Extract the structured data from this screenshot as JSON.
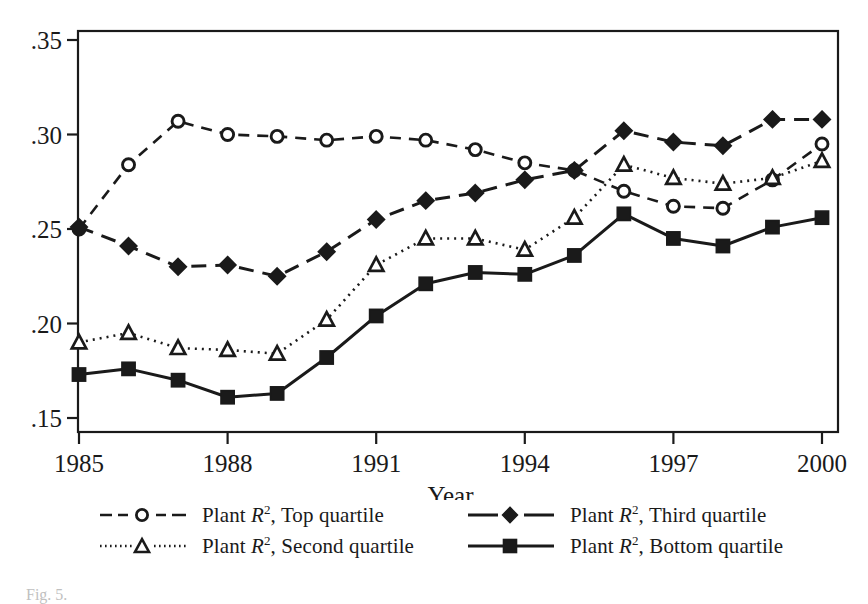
{
  "figure": {
    "caption_fragment": "Fig. 5.",
    "background": "#ffffff",
    "ink": "#1a1a1a"
  },
  "axes": {
    "y_tick_labels": [
      ".35",
      ".30",
      ".25",
      ".20",
      ".15"
    ],
    "x_tick_labels": [
      "1985",
      "1988",
      "1991",
      "1994",
      "1997",
      "2000"
    ],
    "x_title": "Year",
    "y_title": ""
  },
  "legend": {
    "position": "below-plot",
    "entries": [
      {
        "name": "legend-top-quartile",
        "prefix": "Plant ",
        "symbol_text": "R",
        "sup": "2",
        "suffix": ", Top quartile",
        "full_label": "Plant R2, Top quartile",
        "marker": "open-circle",
        "line": "dashed",
        "color": "#1a1a1a"
      },
      {
        "name": "legend-third-quartile",
        "prefix": "Plant ",
        "symbol_text": "R",
        "sup": "2",
        "suffix": ", Third quartile",
        "full_label": "Plant R2, Third quartile",
        "marker": "filled-diamond",
        "line": "long-dash",
        "color": "#1a1a1a"
      },
      {
        "name": "legend-second-quartile",
        "prefix": "Plant ",
        "symbol_text": "R",
        "sup": "2",
        "suffix": ", Second quartile",
        "full_label": "Plant R2, Second quartile",
        "marker": "open-triangle",
        "line": "dotted",
        "color": "#1a1a1a"
      },
      {
        "name": "legend-bottom-quartile",
        "prefix": "Plant ",
        "symbol_text": "R",
        "sup": "2",
        "suffix": ", Bottom quartile",
        "full_label": "Plant R2, Bottom quartile",
        "marker": "filled-square",
        "line": "solid",
        "color": "#1a1a1a"
      }
    ]
  },
  "chart_data": {
    "type": "line",
    "title": "",
    "subtitle": "",
    "xlabel": "Year",
    "ylabel": "",
    "xlim": [
      1985,
      2000
    ],
    "ylim": [
      0.15,
      0.35
    ],
    "x_ticks": [
      1985,
      1988,
      1991,
      1994,
      1997,
      2000
    ],
    "x_tick_labels": [
      "1985",
      "1988",
      "1991",
      "1994",
      "1997",
      "2000"
    ],
    "y_ticks": [
      0.15,
      0.2,
      0.25,
      0.3,
      0.35
    ],
    "y_tick_labels": [
      ".15",
      ".20",
      ".25",
      ".30",
      ".35"
    ],
    "grid": false,
    "legend_position": "bottom",
    "x": [
      1985,
      1986,
      1987,
      1988,
      1989,
      1990,
      1991,
      1992,
      1993,
      1994,
      1995,
      1996,
      1997,
      1998,
      1999,
      2000
    ],
    "series": [
      {
        "name": "Plant R2, Top quartile",
        "marker": "open-circle",
        "line": "dashed",
        "color": "#1a1a1a",
        "values": [
          0.25,
          0.284,
          0.307,
          0.3,
          0.299,
          0.297,
          0.299,
          0.297,
          0.292,
          0.285,
          0.281,
          0.27,
          0.262,
          0.261,
          0.276,
          0.295
        ]
      },
      {
        "name": "Plant R2, Third quartile",
        "marker": "filled-diamond",
        "line": "long-dash",
        "color": "#1a1a1a",
        "values": [
          0.251,
          0.241,
          0.23,
          0.231,
          0.225,
          0.238,
          0.255,
          0.265,
          0.269,
          0.276,
          0.281,
          0.302,
          0.296,
          0.294,
          0.308,
          0.308
        ]
      },
      {
        "name": "Plant R2, Second quartile",
        "marker": "open-triangle",
        "line": "dotted",
        "color": "#1a1a1a",
        "values": [
          0.19,
          0.195,
          0.187,
          0.186,
          0.184,
          0.202,
          0.231,
          0.245,
          0.245,
          0.239,
          0.256,
          0.284,
          0.277,
          0.274,
          0.277,
          0.286
        ]
      },
      {
        "name": "Plant R2, Bottom quartile",
        "marker": "filled-square",
        "line": "solid",
        "color": "#1a1a1a",
        "values": [
          0.173,
          0.176,
          0.17,
          0.161,
          0.163,
          0.182,
          0.204,
          0.221,
          0.227,
          0.226,
          0.236,
          0.258,
          0.245,
          0.241,
          0.251,
          0.256
        ]
      }
    ]
  }
}
